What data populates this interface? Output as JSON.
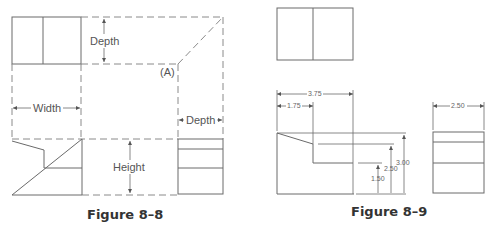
{
  "figures": [
    {
      "caption": "Figure 8–8",
      "labels": {
        "depth_top": "Depth",
        "point_a": "(A)",
        "width": "Width",
        "depth_side": "Depth",
        "height": "Height"
      }
    },
    {
      "caption": "Figure 8–9",
      "dimensions": {
        "overall_width": "3.75",
        "partial_width": "1.75",
        "side_depth": "2.50",
        "height_low": "1.50",
        "height_mid": "2.50",
        "height_total": "3.00"
      }
    }
  ],
  "colors": {
    "line": "#6a6a6a",
    "text": "#555555",
    "caption": "#333333"
  }
}
